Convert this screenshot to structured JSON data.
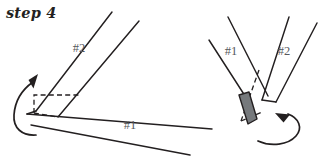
{
  "figure": {
    "title": "step 4",
    "background_color": "#ffffff",
    "ink_color": "#231f20",
    "label_color": "#55585c",
    "shade_color": "#76797c",
    "panels": [
      {
        "id": "left-panel",
        "name": "before-fold-view",
        "labels": [
          {
            "id": "left-strip-2",
            "text": "#2",
            "x": 79,
            "y": 48
          },
          {
            "id": "left-strip-1",
            "text": "#1",
            "x": 130,
            "y": 125
          }
        ],
        "arrow": {
          "id": "left-fold-arrow",
          "direction": "counter-clockwise-up",
          "description": "curved arrow looping around the left corner pointing up-right"
        },
        "dashed_region": {
          "id": "left-hidden-square",
          "description": "dashed parallelogram marking the hidden overlap square"
        }
      },
      {
        "id": "right-panel",
        "name": "after-fold-view",
        "labels": [
          {
            "id": "right-strip-1",
            "text": "#1",
            "x": 231,
            "y": 51
          },
          {
            "id": "right-strip-2",
            "text": "#2",
            "x": 284,
            "y": 51
          }
        ],
        "arrow": {
          "id": "right-fold-arrow",
          "direction": "clockwise-up-left",
          "description": "curved arrow looping under the vertex pointing up-left"
        },
        "dashed_region": {
          "id": "right-hidden-edge",
          "description": "dashed line marking the hidden folded edge"
        },
        "shaded_region": {
          "id": "right-shaded-flap",
          "description": "gray filled narrow parallelogram showing the folded flap",
          "color": "#76797c"
        }
      }
    ]
  }
}
